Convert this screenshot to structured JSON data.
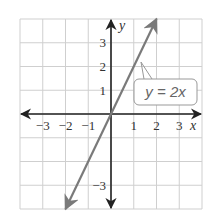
{
  "chart_data": {
    "type": "line",
    "title": "",
    "xlabel": "x",
    "ylabel": "y",
    "xlim": [
      -4,
      4
    ],
    "ylim": [
      -4,
      4
    ],
    "grid": true,
    "x_ticks": [
      -3,
      -2,
      -1,
      1,
      2,
      3
    ],
    "y_ticks": [
      3,
      2,
      1,
      -3
    ],
    "x_tick_labels": [
      "−3",
      "−2",
      "−1",
      "1",
      "2",
      "3"
    ],
    "y_tick_labels": [
      "3",
      "2",
      "1",
      "−3"
    ],
    "series": [
      {
        "name": "y = 2x",
        "equation": "y = 2x",
        "slope": 2,
        "intercept": 0,
        "x": [
          -2,
          2
        ],
        "y": [
          -4,
          4
        ],
        "color": "#7a7a7a"
      }
    ],
    "annotations": [
      {
        "text": "y = 2x",
        "points_to": [
          1.25,
          2.5
        ]
      }
    ],
    "axis_color": "#222222",
    "grid_color": "#cfcfcf"
  },
  "labels": {
    "x_axis": "x",
    "y_axis": "y",
    "equation": "y = 2x"
  }
}
